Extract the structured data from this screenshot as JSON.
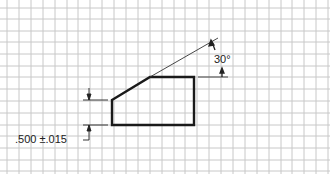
{
  "diagram": {
    "type": "technical drawing on grid paper",
    "grid": {
      "spacing_px": 11.9,
      "origin_x": 7,
      "origin_y": 8,
      "line_color": "#c4c4c4"
    },
    "shape": {
      "description": "Trapezoidal profile with chamfered top-left corner",
      "points": [
        [
          112,
          100
        ],
        [
          150,
          77
        ],
        [
          194,
          77
        ],
        [
          194,
          125
        ],
        [
          112,
          125
        ]
      ],
      "stroke_color": "#1a1a1a"
    },
    "angle_dimension": {
      "label": "30°"
    },
    "height_dimension": {
      "label": ".500 ±.015"
    }
  }
}
